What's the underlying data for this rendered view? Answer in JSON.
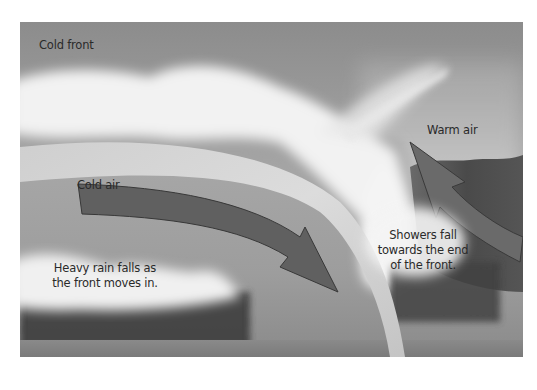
{
  "diagram": {
    "title": "Cold front",
    "labels": {
      "cold_air": "Cold air",
      "warm_air": "Warm air",
      "heavy_rain_line1": "Heavy rain falls as",
      "heavy_rain_line2": "the front moves in.",
      "showers_line1": "Showers fall",
      "showers_line2": "towards the end",
      "showers_line3": "of the front."
    },
    "colors": {
      "sky_top": "#8e8e8e",
      "sky_mid": "#a9a9a9",
      "cloud": "#f4f4f4",
      "cold_air_band": "#d6d6d6",
      "arrow_fill": "#5f5f5f",
      "arrow_stroke": "#3a3a3a",
      "warm_hill": "#4a4a4a",
      "rain": "#303030",
      "ground": "#888888"
    }
  }
}
